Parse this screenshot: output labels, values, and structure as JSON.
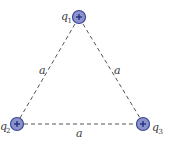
{
  "diagram": {
    "type": "equilateral-triangle-charges",
    "colors": {
      "edge": "#555555",
      "charge_fill": "#8a93cc",
      "charge_stroke": "#3b4597",
      "plus": "#1f2a7a",
      "text": "#3a3a3a"
    },
    "charges": [
      {
        "id": "q1",
        "label": "q",
        "subscript": "1",
        "sign": "+",
        "x": 79,
        "y": 17
      },
      {
        "id": "q2",
        "label": "q",
        "subscript": "2",
        "sign": "+",
        "x": 17,
        "y": 124
      },
      {
        "id": "q3",
        "label": "q",
        "subscript": "3",
        "sign": "+",
        "x": 143,
        "y": 124
      }
    ],
    "sides": [
      {
        "id": "left",
        "label": "a"
      },
      {
        "id": "right",
        "label": "a"
      },
      {
        "id": "bottom",
        "label": "a"
      }
    ]
  }
}
